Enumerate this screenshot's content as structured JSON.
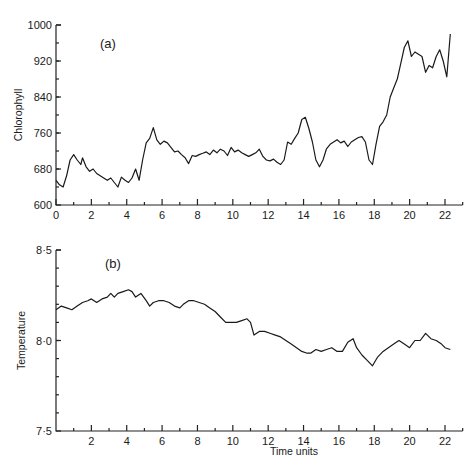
{
  "chart_data": [
    {
      "type": "line",
      "panel_label": "(a)",
      "title": "",
      "xlabel": "",
      "ylabel": "Chlorophyll",
      "xlim": [
        0,
        23
      ],
      "ylim": [
        600,
        1000
      ],
      "x_ticks": [
        0,
        2,
        4,
        6,
        8,
        10,
        12,
        14,
        16,
        18,
        20,
        22
      ],
      "x_tick_labels": [
        "0",
        "2",
        "4",
        "6",
        "8",
        "10",
        "12",
        "14",
        "16",
        "18",
        "20",
        "22"
      ],
      "y_ticks": [
        600,
        680,
        760,
        840,
        920,
        1000
      ],
      "y_tick_labels": [
        "600",
        "680",
        "760",
        "840",
        "920",
        "1000"
      ],
      "grid": false,
      "series": [
        {
          "name": "Chlorophyll",
          "x": [
            0,
            0.2,
            0.4,
            0.6,
            0.8,
            1.0,
            1.2,
            1.4,
            1.5,
            1.7,
            1.9,
            2.1,
            2.3,
            2.5,
            2.7,
            2.9,
            3.1,
            3.3,
            3.5,
            3.7,
            3.9,
            4.1,
            4.3,
            4.5,
            4.7,
            4.9,
            5.1,
            5.3,
            5.5,
            5.7,
            5.9,
            6.1,
            6.3,
            6.5,
            6.7,
            6.9,
            7.1,
            7.3,
            7.5,
            7.7,
            7.9,
            8.1,
            8.3,
            8.5,
            8.7,
            8.9,
            9.1,
            9.3,
            9.5,
            9.7,
            9.9,
            10.1,
            10.3,
            10.5,
            10.7,
            10.9,
            11.1,
            11.3,
            11.5,
            11.7,
            11.9,
            12.1,
            12.3,
            12.5,
            12.7,
            12.9,
            13.1,
            13.3,
            13.5,
            13.7,
            13.9,
            14.1,
            14.3,
            14.5,
            14.7,
            14.9,
            15.1,
            15.3,
            15.5,
            15.7,
            15.9,
            16.1,
            16.3,
            16.5,
            16.7,
            16.9,
            17.1,
            17.3,
            17.5,
            17.7,
            17.9,
            18.1,
            18.3,
            18.5,
            18.7,
            18.9,
            19.1,
            19.3,
            19.5,
            19.7,
            19.9,
            20.1,
            20.3,
            20.5,
            20.7,
            20.9,
            21.1,
            21.3,
            21.5,
            21.7,
            21.9,
            22.1,
            22.3
          ],
          "values": [
            655,
            645,
            640,
            665,
            700,
            712,
            700,
            690,
            705,
            685,
            675,
            680,
            670,
            665,
            660,
            655,
            660,
            650,
            640,
            662,
            655,
            650,
            660,
            680,
            655,
            700,
            738,
            748,
            772,
            745,
            735,
            742,
            738,
            728,
            718,
            720,
            712,
            705,
            692,
            710,
            708,
            712,
            715,
            718,
            712,
            722,
            716,
            724,
            720,
            710,
            728,
            718,
            722,
            716,
            712,
            708,
            712,
            716,
            724,
            708,
            700,
            698,
            702,
            695,
            690,
            700,
            740,
            735,
            748,
            760,
            790,
            795,
            770,
            740,
            700,
            685,
            700,
            725,
            735,
            740,
            745,
            738,
            742,
            730,
            740,
            745,
            750,
            752,
            740,
            700,
            690,
            735,
            775,
            785,
            800,
            840,
            860,
            880,
            915,
            950,
            965,
            930,
            940,
            935,
            930,
            895,
            910,
            905,
            930,
            945,
            920,
            885,
            980
          ],
          "color": "#1a1a1a"
        }
      ]
    },
    {
      "type": "line",
      "panel_label": "(b)",
      "title": "",
      "xlabel": "Time units",
      "ylabel": "Temperature",
      "xlim": [
        0,
        23
      ],
      "ylim": [
        7.5,
        8.5
      ],
      "x_ticks": [
        2,
        4,
        6,
        8,
        10,
        12,
        14,
        16,
        18,
        20,
        22
      ],
      "x_tick_labels": [
        "2",
        "4",
        "6",
        "8",
        "10",
        "12",
        "14",
        "16",
        "18",
        "20",
        "22"
      ],
      "y_ticks": [
        7.5,
        8.0,
        8.5
      ],
      "y_tick_labels": [
        "7·5",
        "8·0",
        "8·5"
      ],
      "grid": false,
      "series": [
        {
          "name": "Temperature",
          "x": [
            0,
            0.3,
            0.6,
            0.9,
            1.2,
            1.5,
            1.8,
            2.0,
            2.3,
            2.6,
            2.9,
            3.1,
            3.3,
            3.5,
            3.8,
            4.1,
            4.3,
            4.5,
            4.8,
            5.1,
            5.3,
            5.5,
            5.8,
            6.1,
            6.4,
            6.7,
            7.0,
            7.2,
            7.5,
            7.8,
            8.1,
            8.4,
            8.7,
            9.0,
            9.3,
            9.6,
            9.9,
            10.2,
            10.5,
            10.8,
            11.0,
            11.2,
            11.5,
            11.8,
            12.1,
            12.4,
            12.7,
            13.0,
            13.3,
            13.6,
            13.9,
            14.2,
            14.4,
            14.7,
            15.0,
            15.3,
            15.6,
            15.9,
            16.2,
            16.5,
            16.8,
            17.0,
            17.3,
            17.6,
            17.9,
            18.2,
            18.5,
            18.8,
            19.1,
            19.4,
            19.7,
            20.0,
            20.3,
            20.6,
            20.9,
            21.2,
            21.5,
            21.8,
            22.0,
            22.3
          ],
          "values": [
            8.17,
            8.19,
            8.18,
            8.17,
            8.19,
            8.21,
            8.22,
            8.23,
            8.21,
            8.23,
            8.24,
            8.26,
            8.24,
            8.26,
            8.27,
            8.28,
            8.27,
            8.24,
            8.26,
            8.22,
            8.19,
            8.21,
            8.22,
            8.22,
            8.21,
            8.19,
            8.18,
            8.2,
            8.22,
            8.22,
            8.21,
            8.2,
            8.18,
            8.16,
            8.13,
            8.1,
            8.1,
            8.1,
            8.11,
            8.12,
            8.1,
            8.03,
            8.05,
            8.05,
            8.04,
            8.03,
            8.02,
            8.0,
            7.98,
            7.96,
            7.94,
            7.93,
            7.93,
            7.95,
            7.94,
            7.95,
            7.96,
            7.94,
            7.94,
            7.99,
            8.01,
            7.96,
            7.92,
            7.89,
            7.86,
            7.91,
            7.94,
            7.96,
            7.98,
            8.0,
            7.98,
            7.96,
            8.0,
            8.0,
            8.04,
            8.01,
            8.0,
            7.98,
            7.96,
            7.95
          ],
          "color": "#1a1a1a"
        }
      ]
    }
  ],
  "panels": {
    "a": {
      "label": "(a)",
      "ylabel": "Chlorophyll"
    },
    "b": {
      "label": "(b)",
      "ylabel": "Temperature",
      "xlabel": "Time units"
    }
  }
}
